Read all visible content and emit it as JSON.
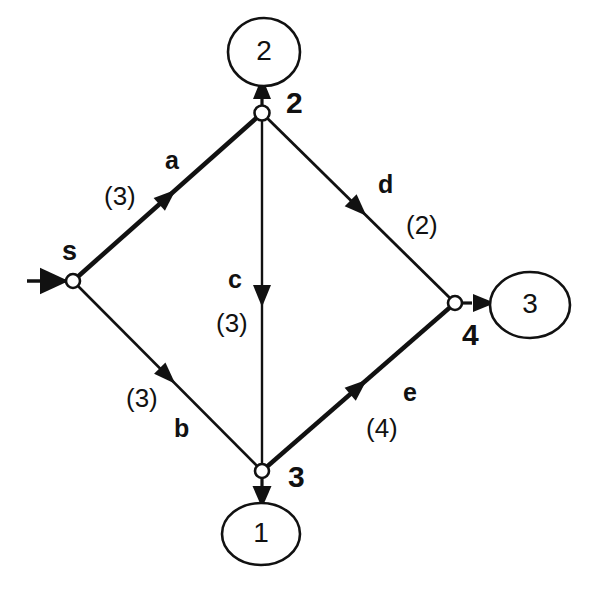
{
  "diagram": {
    "background_color": "#ffffff",
    "stroke_color": "#111111",
    "nodes": [
      {
        "id": "s",
        "label": "s",
        "cx": 73,
        "cy": 281,
        "r": 7,
        "label_x": 62,
        "label_y": 238
      },
      {
        "id": "n2",
        "label": "2",
        "cx": 262,
        "cy": 113,
        "r": 7,
        "label_x": 286,
        "label_y": 88
      },
      {
        "id": "n3",
        "label": "3",
        "cx": 262,
        "cy": 471,
        "r": 7,
        "label_x": 288,
        "label_y": 462
      },
      {
        "id": "n4",
        "label": "4",
        "cx": 455,
        "cy": 303,
        "r": 7,
        "label_x": 462,
        "label_y": 320
      }
    ],
    "terminals": [
      {
        "id": "t2",
        "label": "2",
        "cx": 264,
        "cy": 52,
        "rx": 36,
        "ry": 34
      },
      {
        "id": "t1",
        "label": "1",
        "cx": 261,
        "cy": 534,
        "rx": 39,
        "ry": 31
      },
      {
        "id": "t3",
        "label": "3",
        "cx": 530,
        "cy": 305,
        "rx": 40,
        "ry": 33
      }
    ],
    "edges": [
      {
        "id": "a",
        "name": "a",
        "capacity": "(3)",
        "from": "s",
        "to": "n2",
        "bold": true,
        "name_x": 165,
        "name_y": 148,
        "cap_x": 104,
        "cap_y": 183
      },
      {
        "id": "b",
        "name": "b",
        "capacity": "(3)",
        "from": "s",
        "to": "n3",
        "bold": false,
        "name_x": 174,
        "name_y": 416,
        "cap_x": 126,
        "cap_y": 385
      },
      {
        "id": "c",
        "name": "c",
        "capacity": "(3)",
        "from": "n2",
        "to": "n3",
        "bold": false,
        "name_x": 228,
        "name_y": 267,
        "cap_x": 216,
        "cap_y": 310
      },
      {
        "id": "d",
        "name": "d",
        "capacity": "(2)",
        "from": "n2",
        "to": "n4",
        "bold": false,
        "name_x": 378,
        "name_y": 172,
        "cap_x": 406,
        "cap_y": 212
      },
      {
        "id": "e",
        "name": "e",
        "capacity": "(4)",
        "from": "n3",
        "to": "n4",
        "bold": true,
        "name_x": 403,
        "name_y": 380,
        "cap_x": 366,
        "cap_y": 415
      }
    ],
    "source_arrow": {
      "id": "source-inflow",
      "x1": 27,
      "y1": 281,
      "x2": 73,
      "y2": 281
    },
    "sink_arrows": [
      {
        "id": "arrow-n2-to-t2",
        "x1": 262,
        "y1": 113,
        "x2": 262,
        "y2": 86
      },
      {
        "id": "arrow-n3-to-t1",
        "x1": 262,
        "y1": 471,
        "x2": 262,
        "y2": 503
      },
      {
        "id": "arrow-n4-to-t3",
        "x1": 455,
        "y1": 303,
        "x2": 490,
        "y2": 303
      }
    ]
  }
}
